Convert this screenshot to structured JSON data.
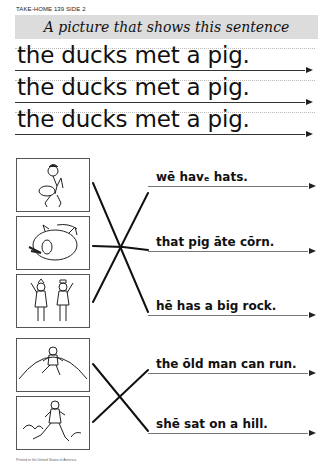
{
  "header": {
    "label": "TAKE-HOME 139 SIDE 2"
  },
  "banner": {
    "title": "A picture that shows this sentence"
  },
  "copy_sentences": [
    "the ducks met a pig.",
    "the ducks met a pig.",
    "the ducks met a pig."
  ],
  "pictures": [
    {
      "id": "boy-lifting-rock",
      "description": "boy lifting a big rock"
    },
    {
      "id": "pig-eating-corn",
      "description": "pig eating corn"
    },
    {
      "id": "two-children-hats",
      "description": "two children wearing hats"
    },
    {
      "id": "girl-on-hill",
      "description": "girl sitting on a hill"
    },
    {
      "id": "old-man-running",
      "description": "old man running"
    }
  ],
  "answers": [
    "wē havₑ hats.",
    "that pig āte cōrn.",
    "hē has a big rock.",
    "the ōld man can run.",
    "shē sat on a hill."
  ],
  "footer": {
    "text": "Printed in the United States of America"
  }
}
